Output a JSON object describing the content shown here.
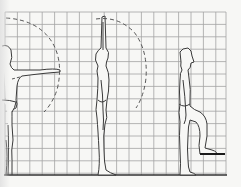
{
  "diagram": {
    "type": "anthropometric-reach-diagram",
    "background": "#f7f7f5",
    "grid": {
      "color": "#9a9a9a",
      "x_start": 5,
      "x_end": 226,
      "y_start": 12,
      "y_end": 175,
      "cell": 12.4,
      "columns": 18,
      "rows": 13
    },
    "baseline": {
      "y": 175,
      "color": "#333333"
    },
    "figures": [
      {
        "id": "front-arm-reach",
        "pose": "standing, arm extended horizontally",
        "arc": "dashed reach arc"
      },
      {
        "id": "overhead-reach",
        "pose": "standing side view, arm raised overhead",
        "arc": "dashed reach arc"
      },
      {
        "id": "step-up",
        "pose": "side view, one foot raised onto step",
        "step": {
          "x1": 200,
          "x2": 225,
          "y": 154
        }
      }
    ],
    "line_color": "#3a3a3a",
    "step_color": "#1a1a1a"
  }
}
